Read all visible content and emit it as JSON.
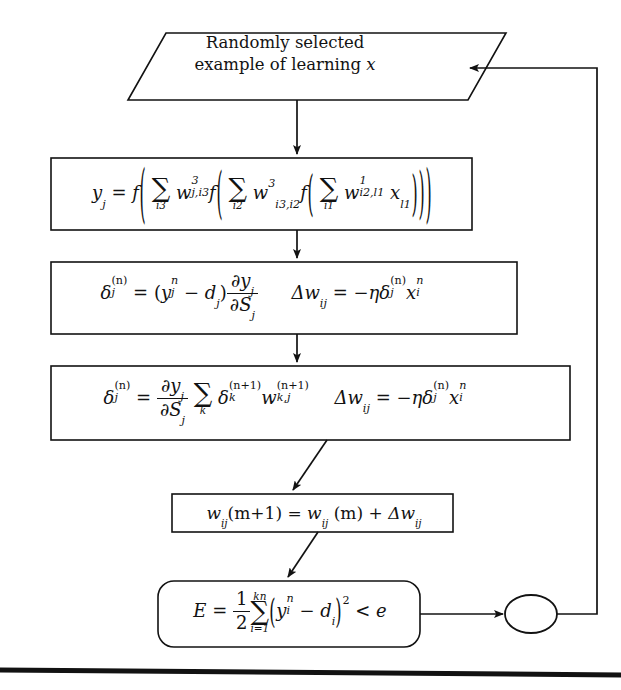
{
  "diagram": {
    "ink_color": "#121212",
    "background_color": "#ffffff"
  },
  "nodes": {
    "input": {
      "shape": "parallelogram",
      "line1": "Randomly selected",
      "line2_prefix": "example of learning ",
      "line2_var": "x"
    },
    "forward_pass": {
      "shape": "rectangle",
      "equation_plain": "y_j = f( SUM_{i3} w^3_{j,i3} f( SUM_{i2} w^3_{i3,i2} f( SUM_{i1} w^1_{i2,l1} x_{l1} )))",
      "lhs": "y",
      "lhs_sub": "j",
      "eq": "=",
      "fn": "f",
      "sum1_index": "i3",
      "w1_base": "w",
      "w1_sup": "3",
      "w1_sub": "j,i3",
      "sum2_index": "i2",
      "w2_base": "w",
      "w2_sup": "3",
      "w2_sub": "i3,i2",
      "sum3_index": "i1",
      "w3_base": "w",
      "w3_sup": "1",
      "w3_sub": "i2,l1",
      "x_base": "x",
      "x_sub": "l1"
    },
    "output_delta": {
      "shape": "rectangle",
      "equation_plain": "delta_j^(n) = (y_j^n - d_j) dy_j/dS_j    Dw_ij = -eta delta_j^(n) x_i^n",
      "delta": "δ",
      "delta_sub": "j",
      "delta_sup": "(n)",
      "eq": "=",
      "y": "y",
      "y_sub": "j",
      "y_sup": "n",
      "minus": "−",
      "d": "d",
      "d_sub": "j",
      "partial": "∂",
      "num_var": "y",
      "num_sub": "j",
      "den_var": "S",
      "den_sub": "j",
      "delta_w": "Δw",
      "delta_w_sub": "ij",
      "eta": "η",
      "x": "x",
      "x_sub": "i",
      "x_sup": "n"
    },
    "hidden_delta": {
      "shape": "rectangle",
      "equation_plain": "delta_j^(n) = (dy_j/dS_j) SUM_k delta_k^(n+1) w_{k,j}^(n+1)   Dw_ij = -eta delta_j^(n) x_i^n",
      "delta": "δ",
      "delta_sub": "j",
      "delta_sup": "(n)",
      "eq": "=",
      "partial": "∂",
      "num_var": "y",
      "num_sub": "j",
      "den_var": "S",
      "den_sub": "j",
      "sum_index": "k",
      "delta_k": "δ",
      "delta_k_sub": "k",
      "delta_k_sup": "(n+1)",
      "w": "w",
      "w_sub": "k,j",
      "w_sup": "(n+1)",
      "delta_w": "Δw",
      "delta_w_sub": "ij",
      "eta": "η",
      "x": "x",
      "x_sub": "i",
      "x_sup": "n"
    },
    "weight_update": {
      "shape": "rectangle",
      "equation_plain": "w_ij(m+1) = w_ij(m) + Dw_ij",
      "w": "w",
      "w_sub": "ij",
      "arg1": "(m+1)",
      "eq": "=",
      "arg2": "(m)",
      "plus": "+",
      "delta_w": "Δw",
      "delta_w_sub": "ij"
    },
    "error_check": {
      "shape": "rounded-rectangle",
      "equation_plain": "E = 1/2 SUM_{i=1}^{kn} ( y_i^n - d_i )^2 < e",
      "E": "E",
      "eq": "=",
      "frac_num": "1",
      "frac_den": "2",
      "sum_upper": "kn",
      "sum_lower": "i=1",
      "y": "y",
      "y_sub": "i",
      "y_sup": "n",
      "minus": "−",
      "d": "d",
      "d_sub": "i",
      "power": "2",
      "less_than": "<",
      "threshold": "e"
    },
    "connector": {
      "shape": "ellipse",
      "label": ""
    }
  },
  "edges": [
    {
      "name": "input-to-forward",
      "from": "input",
      "to": "forward_pass",
      "style": "arrow-down"
    },
    {
      "name": "forward-to-output-delta",
      "from": "forward_pass",
      "to": "output_delta",
      "style": "arrow-down"
    },
    {
      "name": "output-delta-to-hidden-delta",
      "from": "output_delta",
      "to": "hidden_delta",
      "style": "arrow-down"
    },
    {
      "name": "hidden-delta-to-weight-update",
      "from": "hidden_delta",
      "to": "weight_update",
      "style": "arrow-diagonal"
    },
    {
      "name": "weight-update-to-error-check",
      "from": "weight_update",
      "to": "error_check",
      "style": "arrow-diagonal"
    },
    {
      "name": "error-check-to-connector",
      "from": "error_check",
      "to": "connector",
      "style": "arrow-right"
    },
    {
      "name": "connector-feedback-to-input",
      "from": "connector",
      "to": "input",
      "style": "loop-back-left"
    }
  ],
  "footer_rule": {
    "name": "page-rule",
    "visible": true
  }
}
